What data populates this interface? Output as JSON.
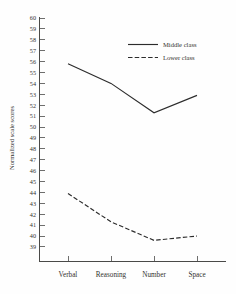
{
  "chart_data": {
    "type": "line",
    "title": "",
    "xlabel": "",
    "ylabel": "Normalized scale scores",
    "categories": [
      "Verbal",
      "Reasoning",
      "Number",
      "Space"
    ],
    "series": [
      {
        "name": "Middle class",
        "style": "solid",
        "values": [
          55.8,
          54.0,
          51.3,
          52.9
        ]
      },
      {
        "name": "Lower class",
        "style": "dashed",
        "values": [
          43.9,
          41.3,
          39.6,
          40.0
        ]
      }
    ],
    "ylim": [
      38.5,
      60.5
    ],
    "yticks": [
      60,
      59,
      58,
      57,
      56,
      55,
      54,
      53,
      52,
      51,
      50,
      49,
      48,
      47,
      46,
      45,
      44,
      43,
      42,
      41,
      40,
      39
    ],
    "grid": false,
    "legend_position": "top-right",
    "legend": [
      "Middle class",
      "Lower class"
    ]
  },
  "axis": {
    "y_title": "Normalized scale scores",
    "tick_labels": [
      "60",
      "59",
      "58",
      "57",
      "56",
      "55",
      "54",
      "53",
      "52",
      "51",
      "50",
      "49",
      "48",
      "47",
      "46",
      "45",
      "44",
      "43",
      "42",
      "41",
      "40",
      "39"
    ],
    "category_labels": [
      "Verbal",
      "Reasoning",
      "Number",
      "Space"
    ]
  },
  "legend": {
    "entries": [
      {
        "label": "Middle class",
        "style": "solid"
      },
      {
        "label": "Lower class",
        "style": "dashed"
      }
    ]
  },
  "colors": {
    "line": "#2c2c2c",
    "axis": "#4a4a48",
    "text": "#33322f",
    "background": "#fefefe"
  }
}
